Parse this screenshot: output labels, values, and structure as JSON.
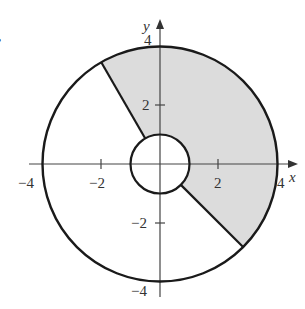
{
  "figure": {
    "problem_marker": ".",
    "axes": {
      "x_label": "x",
      "y_label": "y",
      "x_ticks": [
        {
          "value": -4,
          "label": "−4"
        },
        {
          "value": -2,
          "label": "−2"
        },
        {
          "value": 2,
          "label": "2"
        },
        {
          "value": 4,
          "label": "4"
        }
      ],
      "y_ticks": [
        {
          "value": 4,
          "label": "4"
        },
        {
          "value": 2,
          "label": "2"
        },
        {
          "value": -2,
          "label": "−2"
        },
        {
          "value": -4,
          "label": "−4"
        }
      ]
    },
    "region": {
      "inner_radius": 1,
      "outer_radius": 4,
      "theta_start_deg": -45,
      "theta_end_deg": 120,
      "shade_color": "#dcdcdc",
      "stroke_color": "#1a1a1a"
    }
  }
}
